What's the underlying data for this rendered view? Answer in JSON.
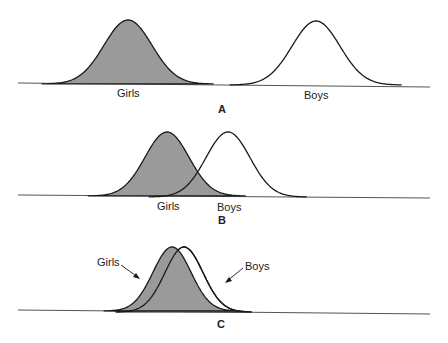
{
  "colors": {
    "girls_fill": "#9a9a9a",
    "boys_fill": "#ffffff",
    "stroke": "#1a1a1a",
    "baseline": "#555555"
  },
  "panels": [
    {
      "id": "A",
      "label": "A",
      "description": "Two completely separated distributions",
      "baseline_y": 84,
      "girls": {
        "label": "Girls",
        "peak_x": 128,
        "peak_y": 20,
        "sigma": 24
      },
      "boys": {
        "label": "Boys",
        "peak_x": 316,
        "peak_y": 21,
        "sigma": 24
      }
    },
    {
      "id": "B",
      "label": "B",
      "description": "Partially overlapping distributions",
      "baseline_y": 196,
      "girls": {
        "label": "Girls",
        "peak_x": 167,
        "peak_y": 132,
        "sigma": 22
      },
      "boys": {
        "label": "Boys",
        "peak_x": 228,
        "peak_y": 132,
        "sigma": 22
      }
    },
    {
      "id": "C",
      "label": "C",
      "description": "Almost completely overlapping distributions",
      "baseline_y": 311,
      "girls": {
        "label": "Girls",
        "peak_x": 172,
        "peak_y": 247,
        "sigma": 19
      },
      "boys": {
        "label": "Boys",
        "peak_x": 184,
        "peak_y": 247,
        "sigma": 19
      }
    }
  ]
}
